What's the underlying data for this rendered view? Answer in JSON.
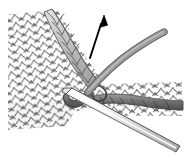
{
  "illustration": {
    "title": "Knitting technique diagram",
    "subject": "picking up stitch along selvedge edge with knitting needle",
    "alt_text": "Knitted stockinette fabric with a needle inserted at the edge, working yarn looped around, and an arrow indicating the pull-through direction",
    "canvas": {
      "width": 189,
      "height": 162,
      "background": "#ffffff"
    },
    "colors": {
      "background": "#ffffff",
      "fabric_fill": "#ffffff",
      "fabric_outline": "#3a3a3a",
      "fabric_shadow": "#d9d9d9",
      "selvedge_fill": "#c3c3c3",
      "selvedge_outline": "#555555",
      "working_yarn": "#8c8c8c",
      "working_yarn_outline": "#5a5a5a",
      "dark_yarn": "#6e6e6e",
      "dark_yarn_outline": "#3f3f3f",
      "needle_fill": "#f2f2f2",
      "needle_shade": "#bdbdbd",
      "needle_outline": "#4a4a4a",
      "arrow": "#000000"
    },
    "elements": [
      {
        "name": "knitted-fabric",
        "label": "Knitted stockinette fabric",
        "position": "left and lower-centre of frame"
      },
      {
        "name": "selvedge-edge",
        "label": "Shaded selvedge chain of edge stitches",
        "position": "diagonal from top-centre to centre"
      },
      {
        "name": "direction-arrow",
        "label": "Arrow showing direction to pull the new loop",
        "from": [
          90,
          58
        ],
        "to": [
          104,
          17
        ]
      },
      {
        "name": "working-yarn",
        "label": "Working yarn strand",
        "position": "curves from centre toward upper right"
      },
      {
        "name": "dark-yarn-row",
        "label": "Darker yarn row of newly picked-up stitches",
        "position": "horizontal band on the right"
      },
      {
        "name": "knitting-needle",
        "label": "Knitting needle inserted through the edge stitch",
        "position": "diagonal toward lower right"
      }
    ]
  }
}
